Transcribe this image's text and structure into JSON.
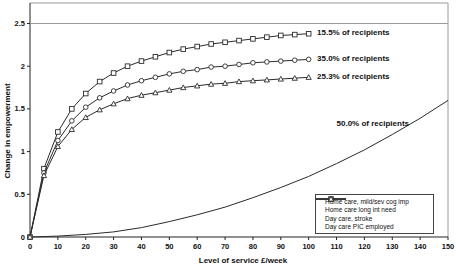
{
  "colors": {
    "line": "#2b2b2b",
    "axis": "#222222",
    "border": "#9a9a9a",
    "text": "#111111",
    "marker_fill": "#ffffff",
    "background": "#ffffff"
  },
  "chart_data": {
    "type": "line",
    "title": "",
    "xlabel": "Level of service £/week",
    "ylabel": "Change in empowerment",
    "xlim": [
      0,
      150
    ],
    "ylim": [
      0,
      2.74
    ],
    "grid": "single-line-at-2.5",
    "gridlines_y": [
      2.5
    ],
    "x_ticks": [
      0,
      10,
      20,
      30,
      40,
      50,
      60,
      70,
      80,
      90,
      100,
      110,
      120,
      130,
      140,
      150
    ],
    "y_ticks": [
      0,
      0.5,
      1,
      1.5,
      2,
      2.5
    ],
    "y_tick_labels": [
      "0",
      "0.5",
      "1",
      "1.5",
      "2",
      "2.5"
    ],
    "legend_position": "inside-bottom-right",
    "series": [
      {
        "name": "Home care, mild/sev cog imp",
        "marker": "none",
        "x": [
          0,
          10,
          20,
          30,
          40,
          50,
          60,
          70,
          80,
          90,
          100,
          110,
          120,
          130,
          140,
          150
        ],
        "y": [
          0,
          0.01,
          0.03,
          0.06,
          0.11,
          0.18,
          0.26,
          0.35,
          0.46,
          0.58,
          0.71,
          0.86,
          1.02,
          1.2,
          1.39,
          1.6
        ]
      },
      {
        "name": "Home care long int need",
        "marker": "square",
        "x": [
          0,
          5,
          10,
          15,
          20,
          25,
          30,
          35,
          40,
          45,
          50,
          55,
          60,
          65,
          70,
          75,
          80,
          85,
          90,
          95,
          100
        ],
        "y": [
          0,
          0.8,
          1.23,
          1.5,
          1.68,
          1.82,
          1.92,
          2.0,
          2.06,
          2.11,
          2.16,
          2.2,
          2.23,
          2.26,
          2.28,
          2.3,
          2.32,
          2.34,
          2.36,
          2.37,
          2.38
        ]
      },
      {
        "name": "Day care, stroke",
        "marker": "circle",
        "x": [
          0,
          5,
          10,
          15,
          20,
          25,
          30,
          35,
          40,
          45,
          50,
          55,
          60,
          65,
          70,
          75,
          80,
          85,
          90,
          95,
          100
        ],
        "y": [
          0,
          0.75,
          1.13,
          1.36,
          1.52,
          1.63,
          1.71,
          1.78,
          1.83,
          1.87,
          1.91,
          1.94,
          1.96,
          1.99,
          2.0,
          2.02,
          2.04,
          2.05,
          2.06,
          2.07,
          2.08
        ]
      },
      {
        "name": "Day care PIC employed",
        "marker": "triangle",
        "x": [
          0,
          5,
          10,
          15,
          20,
          25,
          30,
          35,
          40,
          45,
          50,
          55,
          60,
          65,
          70,
          75,
          80,
          85,
          90,
          95,
          100
        ],
        "y": [
          0,
          0.72,
          1.06,
          1.26,
          1.4,
          1.49,
          1.56,
          1.62,
          1.66,
          1.69,
          1.72,
          1.75,
          1.77,
          1.79,
          1.8,
          1.82,
          1.83,
          1.84,
          1.85,
          1.86,
          1.87
        ]
      }
    ],
    "annotations": [
      {
        "text": "15.5% of recipients",
        "x": 103,
        "y": 2.39
      },
      {
        "text": "35.0% of recipients",
        "x": 103,
        "y": 2.09
      },
      {
        "text": "25.3% of recipients",
        "x": 103,
        "y": 1.88
      },
      {
        "text": "50.0% of recipients",
        "x": 110,
        "y": 1.33
      }
    ],
    "legend_entries": [
      "Home care, mild/sev cog imp",
      "Home care long int need",
      "Day care, stroke",
      "Day care PIC employed"
    ]
  }
}
